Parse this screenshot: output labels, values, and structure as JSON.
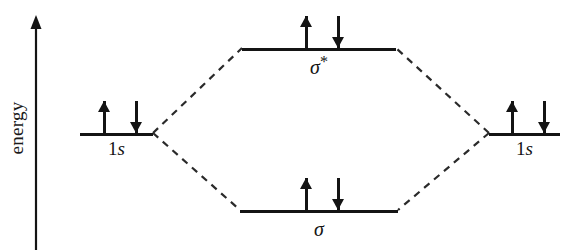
{
  "diagram": {
    "axis": {
      "label": "energy",
      "direction": "up",
      "arrow_icon": "up-arrow-icon"
    },
    "levels": [
      {
        "id": "left-atomic",
        "label_prefix": "1",
        "label_italic": "s",
        "type": "atomic-orbital",
        "electrons": [
          "up",
          "down"
        ]
      },
      {
        "id": "antibonding",
        "label_sigma": "σ",
        "label_star": "*",
        "type": "antibonding-molecular-orbital",
        "electrons": [
          "up",
          "down"
        ]
      },
      {
        "id": "bonding",
        "label_sigma": "σ",
        "label_star": "",
        "type": "bonding-molecular-orbital",
        "electrons": [
          "up",
          "down"
        ]
      },
      {
        "id": "right-atomic",
        "label_prefix": "1",
        "label_italic": "s",
        "type": "atomic-orbital",
        "electrons": [
          "up",
          "down"
        ]
      }
    ],
    "colors": {
      "ink": "#141414",
      "background": "#ffffff"
    }
  }
}
